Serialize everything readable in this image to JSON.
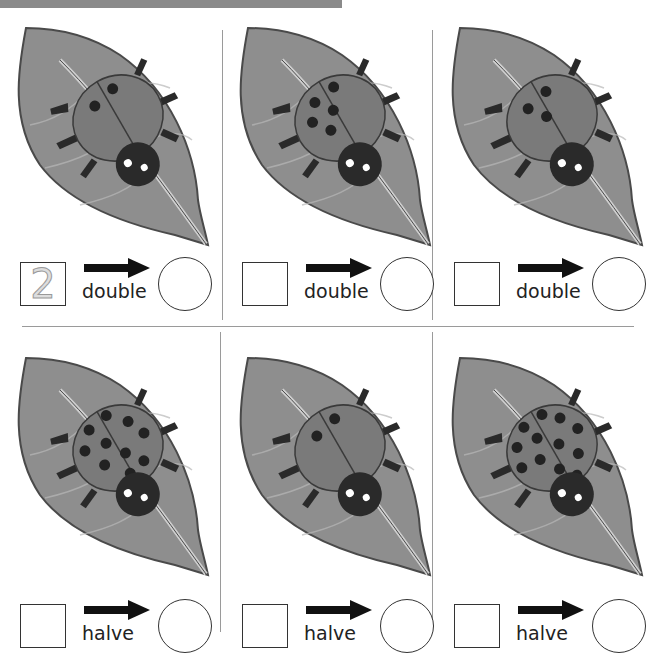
{
  "worksheet": {
    "rows": [
      {
        "operation": "double",
        "cells": [
          {
            "spots": 2,
            "box_value": "2",
            "answer": ""
          },
          {
            "spots": 5,
            "box_value": "",
            "answer": ""
          },
          {
            "spots": 3,
            "box_value": "",
            "answer": ""
          }
        ]
      },
      {
        "operation": "halve",
        "cells": [
          {
            "spots": 10,
            "box_value": "",
            "answer": ""
          },
          {
            "spots": 2,
            "box_value": "",
            "answer": ""
          },
          {
            "spots": 12,
            "box_value": "",
            "answer": ""
          }
        ]
      }
    ],
    "labels": {
      "r0c0": "double",
      "r0c1": "double",
      "r0c2": "double",
      "r1c0": "halve",
      "r1c1": "halve",
      "r1c2": "halve"
    },
    "box_values": {
      "r0c0": "2"
    },
    "colors": {
      "leaf": "#8e8e8e",
      "leaf_outline": "#4a4a4a",
      "ladybug_shell": "#7a7a7a",
      "ladybug_head": "#2a2a2a",
      "spot": "#222222",
      "divider": "#9a9a9a",
      "top_bar": "#8a8a8a"
    }
  }
}
